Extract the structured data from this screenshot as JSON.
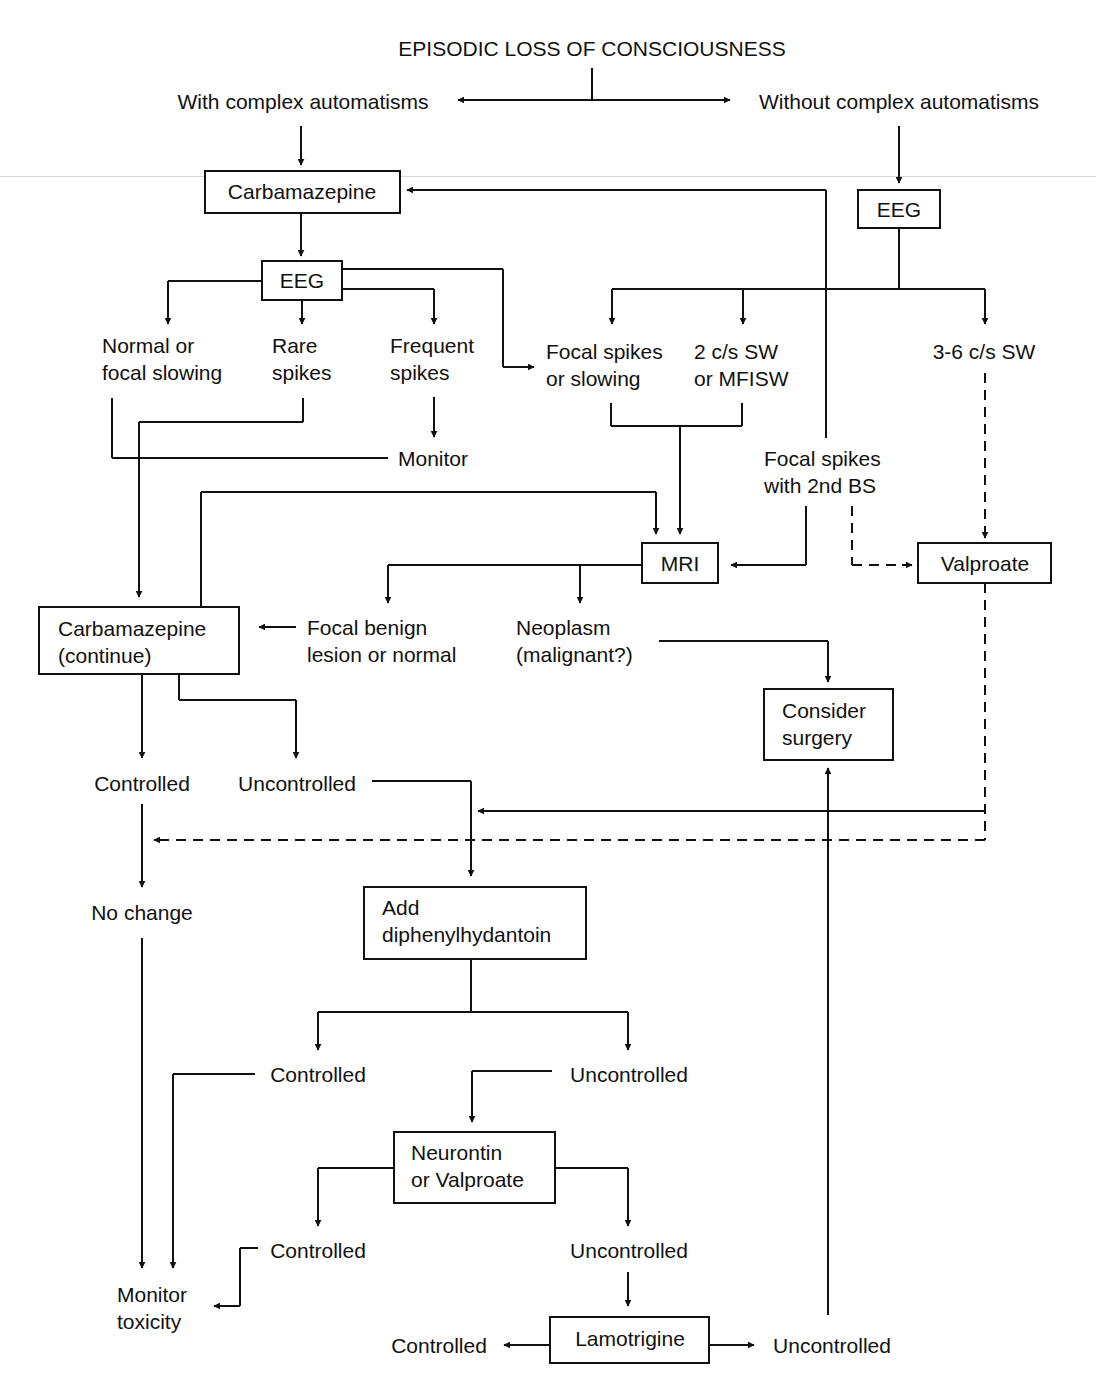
{
  "title": "EPISODIC LOSS OF CONSCIOUSNESS",
  "nodes": {
    "with_auto": "With complex automatisms",
    "without_auto": "Without complex automatisms",
    "carbamazepine": "Carbamazepine",
    "eeg_left": "EEG",
    "eeg_right": "EEG",
    "normal_1": "Normal or",
    "normal_2": "focal slowing",
    "rare_1": "Rare",
    "rare_2": "spikes",
    "frequent_1": "Frequent",
    "frequent_2": "spikes",
    "monitor": "Monitor",
    "focal_1": "Focal spikes",
    "focal_2": "or slowing",
    "sw2_1": "2 c/s SW",
    "sw2_2": "or MFISW",
    "sw36": "3-6 c/s SW",
    "focal2bs_1": "Focal spikes",
    "focal2bs_2": "with 2nd BS",
    "mri": "MRI",
    "valproate": "Valproate",
    "carb_cont_1": "Carbamazepine",
    "carb_cont_2": "(continue)",
    "benign_1": "Focal benign",
    "benign_2": "lesion or normal",
    "neoplasm_1": "Neoplasm",
    "neoplasm_2": "(malignant?)",
    "surgery_1": "Consider",
    "surgery_2": "surgery",
    "controlled_1": "Controlled",
    "uncontrolled_1": "Uncontrolled",
    "no_change": "No change",
    "add_dph_1": "Add",
    "add_dph_2": "diphenylhydantoin",
    "controlled_2": "Controlled",
    "uncontrolled_2": "Uncontrolled",
    "neurontin_1": "Neurontin",
    "neurontin_2": "or Valproate",
    "controlled_3": "Controlled",
    "uncontrolled_3": "Uncontrolled",
    "monitor_tox_1": "Monitor",
    "monitor_tox_2": "toxicity",
    "controlled_4": "Controlled",
    "lamotrigine": "Lamotrigine",
    "uncontrolled_4": "Uncontrolled"
  }
}
